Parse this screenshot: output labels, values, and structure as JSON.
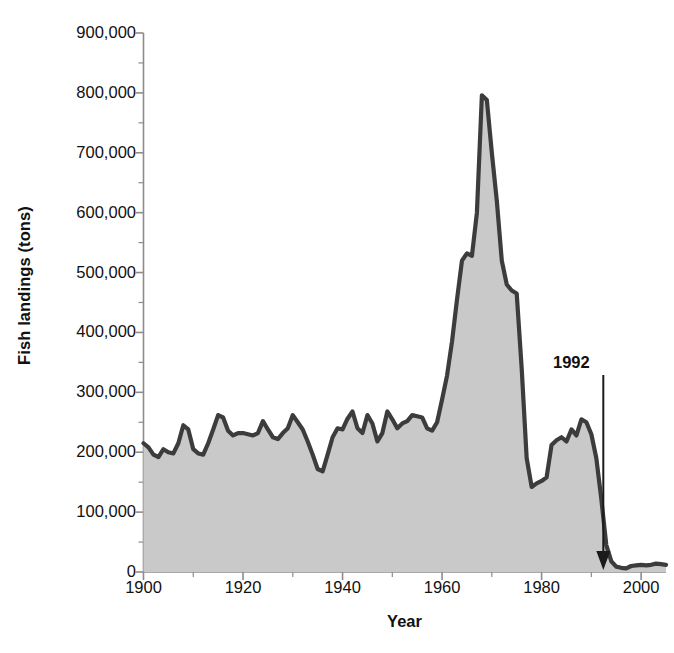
{
  "chart_data": {
    "type": "area",
    "title": "",
    "xlabel": "Year",
    "ylabel": "Fish landings (tons)",
    "xlim": [
      1900,
      2005
    ],
    "ylim": [
      0,
      900000
    ],
    "grid": false,
    "legend": "none",
    "y_ticks": [
      "0",
      "100,000",
      "200,000",
      "300,000",
      "400,000",
      "500,000",
      "600,000",
      "700,000",
      "800,000",
      "900,000"
    ],
    "y_tick_values": [
      0,
      100000,
      200000,
      300000,
      400000,
      500000,
      600000,
      700000,
      800000,
      900000
    ],
    "y_minor_tick_step": 50000,
    "x_ticks": [
      "1900",
      "1920",
      "1940",
      "1960",
      "1980",
      "2000"
    ],
    "x_tick_values": [
      1900,
      1920,
      1940,
      1960,
      1980,
      2000
    ],
    "x_minor_tick_step": 10,
    "fill_color": "#c9c9c9",
    "line_color": "#3c3c3c",
    "axis_color": "#8c8c8c",
    "annotations": [
      {
        "label": "1992",
        "x": 1992,
        "type": "arrow-down",
        "points_to_y": 0
      }
    ],
    "x": [
      1900,
      1901,
      1902,
      1903,
      1904,
      1905,
      1906,
      1907,
      1908,
      1909,
      1910,
      1911,
      1912,
      1913,
      1914,
      1915,
      1916,
      1917,
      1918,
      1919,
      1920,
      1921,
      1922,
      1923,
      1924,
      1925,
      1926,
      1927,
      1928,
      1929,
      1930,
      1931,
      1932,
      1933,
      1934,
      1935,
      1936,
      1937,
      1938,
      1939,
      1940,
      1941,
      1942,
      1943,
      1944,
      1945,
      1946,
      1947,
      1948,
      1949,
      1950,
      1951,
      1952,
      1953,
      1954,
      1955,
      1956,
      1957,
      1958,
      1959,
      1960,
      1961,
      1962,
      1963,
      1964,
      1965,
      1966,
      1967,
      1968,
      1969,
      1970,
      1971,
      1972,
      1973,
      1974,
      1975,
      1976,
      1977,
      1978,
      1979,
      1980,
      1981,
      1982,
      1983,
      1984,
      1985,
      1986,
      1987,
      1988,
      1989,
      1990,
      1991,
      1992,
      1993,
      1994,
      1995,
      1996,
      1997,
      1998,
      1999,
      2000,
      2001,
      2002,
      2003,
      2004,
      2005
    ],
    "values": [
      215000,
      208000,
      196000,
      192000,
      205000,
      200000,
      198000,
      215000,
      245000,
      238000,
      205000,
      198000,
      196000,
      215000,
      238000,
      262000,
      258000,
      236000,
      228000,
      232000,
      232000,
      230000,
      228000,
      232000,
      252000,
      238000,
      225000,
      222000,
      232000,
      240000,
      262000,
      250000,
      238000,
      218000,
      196000,
      172000,
      168000,
      196000,
      225000,
      240000,
      238000,
      256000,
      268000,
      240000,
      232000,
      262000,
      248000,
      218000,
      232000,
      268000,
      255000,
      240000,
      248000,
      252000,
      262000,
      260000,
      258000,
      240000,
      236000,
      250000,
      288000,
      328000,
      385000,
      455000,
      520000,
      532000,
      528000,
      600000,
      796000,
      788000,
      700000,
      620000,
      520000,
      480000,
      470000,
      465000,
      340000,
      190000,
      142000,
      148000,
      152000,
      158000,
      212000,
      220000,
      225000,
      218000,
      238000,
      228000,
      255000,
      250000,
      230000,
      190000,
      122000,
      45000,
      18000,
      9000,
      7000,
      6000,
      10000,
      11000,
      12000,
      11000,
      12000,
      14000,
      13000,
      12000
    ]
  }
}
